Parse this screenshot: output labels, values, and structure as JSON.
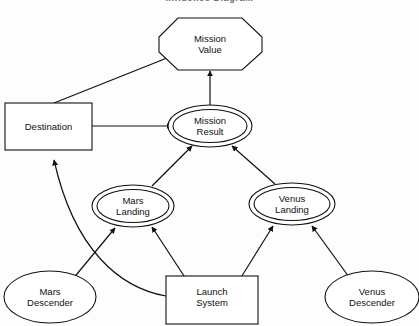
{
  "diagram": {
    "title": "Influence Diagram",
    "type": "influence-diagram",
    "nodes": [
      {
        "id": "mission-value",
        "label_lines": [
          "Mission",
          "Value"
        ],
        "shape": "octagon",
        "role": "value",
        "cx": 210,
        "cy": 44
      },
      {
        "id": "destination",
        "label_lines": [
          "Destination"
        ],
        "shape": "rectangle",
        "role": "decision",
        "cx": 48,
        "cy": 126
      },
      {
        "id": "mission-result",
        "label_lines": [
          "Mission",
          "Result"
        ],
        "shape": "double-ellipse",
        "role": "deterministic",
        "cx": 210,
        "cy": 126
      },
      {
        "id": "mars-landing",
        "label_lines": [
          "Mars",
          "Landing"
        ],
        "shape": "double-ellipse",
        "role": "deterministic",
        "cx": 133,
        "cy": 206
      },
      {
        "id": "venus-landing",
        "label_lines": [
          "Venus",
          "Landing"
        ],
        "shape": "double-ellipse",
        "role": "deterministic",
        "cx": 292,
        "cy": 204
      },
      {
        "id": "mars-descender",
        "label_lines": [
          "Mars",
          "Descender"
        ],
        "shape": "ellipse",
        "role": "chance",
        "cx": 50,
        "cy": 297
      },
      {
        "id": "launch-system",
        "label_lines": [
          "Launch",
          "System"
        ],
        "shape": "rectangle",
        "role": "decision",
        "cx": 212,
        "cy": 297
      },
      {
        "id": "venus-descender",
        "label_lines": [
          "Venus",
          "Descender"
        ],
        "shape": "ellipse",
        "role": "chance",
        "cx": 372,
        "cy": 297
      }
    ],
    "edges": [
      {
        "from": "destination",
        "to": "mission-value",
        "style": "straight"
      },
      {
        "from": "destination",
        "to": "mission-result",
        "style": "straight"
      },
      {
        "from": "mission-result",
        "to": "mission-value",
        "style": "straight"
      },
      {
        "from": "mars-landing",
        "to": "mission-result",
        "style": "straight"
      },
      {
        "from": "venus-landing",
        "to": "mission-result",
        "style": "straight"
      },
      {
        "from": "mars-descender",
        "to": "mars-landing",
        "style": "straight"
      },
      {
        "from": "launch-system",
        "to": "mars-landing",
        "style": "straight"
      },
      {
        "from": "launch-system",
        "to": "venus-landing",
        "style": "straight"
      },
      {
        "from": "venus-descender",
        "to": "venus-landing",
        "style": "straight"
      },
      {
        "from": "launch-system",
        "to": "destination",
        "style": "curved"
      }
    ],
    "colors": {
      "background": "#fdfdfd",
      "stroke": "#111111",
      "text": "#111111",
      "node_fill": "#ffffff"
    }
  }
}
